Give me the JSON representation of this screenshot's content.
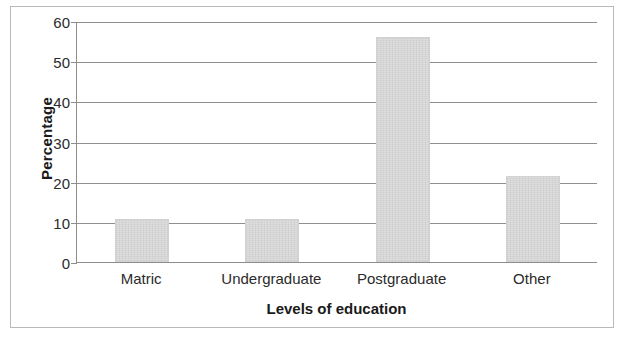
{
  "chart_data": {
    "type": "bar",
    "title": "",
    "categories": [
      "Matric",
      "Undergraduate",
      "Postgraduate",
      "Other"
    ],
    "values": [
      10.8,
      10.8,
      56,
      21.5
    ],
    "xlabel": "Levels of education",
    "ylabel": "Percentage",
    "ylim": [
      0,
      60
    ],
    "ytick_step": 10,
    "yticks": [
      "60",
      "50",
      "40",
      "30",
      "20",
      "10",
      "0"
    ],
    "ytick_values": [
      60,
      50,
      40,
      30,
      20,
      10,
      0
    ],
    "grid": true,
    "grid_axis": "y",
    "legend": false,
    "legend_position": "none",
    "bar_color": "#dcdcdc",
    "grid_color": "#8f8f8f",
    "axis_color": "#8d8d8d",
    "text_color": "#2b2b2b",
    "frame_color": "#b9b9b9"
  }
}
